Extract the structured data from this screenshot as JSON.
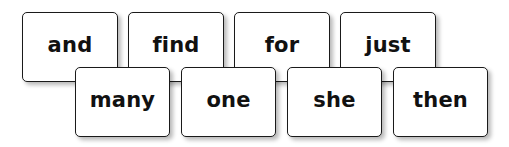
{
  "word_cards": {
    "back_row": [
      {
        "word": "and"
      },
      {
        "word": "find"
      },
      {
        "word": "for"
      },
      {
        "word": "just"
      }
    ],
    "front_row": [
      {
        "word": "many"
      },
      {
        "word": "one"
      },
      {
        "word": "she"
      },
      {
        "word": "then"
      }
    ]
  },
  "colors": {
    "background": "#ffffff",
    "card_fill": "#ffffff",
    "card_border": "#1a1a1a",
    "text": "#111111"
  }
}
